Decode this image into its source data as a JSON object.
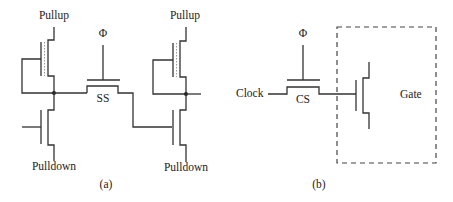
{
  "figure": {
    "panel_a": {
      "caption": "(a)",
      "left_inverter": {
        "pullup_label": "Pullup",
        "pulldown_label": "Pulldown"
      },
      "right_inverter": {
        "pullup_label": "Pullup",
        "pulldown_label": "Pulldown"
      },
      "pass_transistor": {
        "clock_label": "Φ",
        "label": "SS"
      }
    },
    "panel_b": {
      "caption": "(b)",
      "input_label": "Clock",
      "pass_transistor": {
        "clock_label": "Φ",
        "label": "CS"
      },
      "box_label": "Gate"
    }
  },
  "colors": {
    "line": "#333333",
    "dotted": "#999999",
    "background": "#ffffff"
  }
}
